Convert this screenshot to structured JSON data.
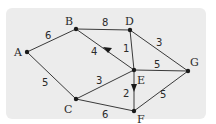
{
  "diagram": {
    "type": "weighted graph",
    "nodes": [
      {
        "id": "A",
        "label": "A",
        "x": 27,
        "y": 52
      },
      {
        "id": "B",
        "label": "B",
        "x": 76,
        "y": 29
      },
      {
        "id": "C",
        "label": "C",
        "x": 76,
        "y": 99
      },
      {
        "id": "D",
        "label": "D",
        "x": 130,
        "y": 30
      },
      {
        "id": "E",
        "label": "E",
        "x": 134,
        "y": 70
      },
      {
        "id": "F",
        "label": "F",
        "x": 134,
        "y": 111
      },
      {
        "id": "G",
        "label": "G",
        "x": 188,
        "y": 71
      }
    ],
    "edges": [
      {
        "from": "A",
        "to": "B",
        "weight": "6",
        "directed": false
      },
      {
        "from": "A",
        "to": "C",
        "weight": "5",
        "directed": false
      },
      {
        "from": "B",
        "to": "D",
        "weight": "8",
        "directed": false
      },
      {
        "from": "E",
        "to": "B",
        "weight": "4",
        "directed": true
      },
      {
        "from": "D",
        "to": "E",
        "weight": "1",
        "directed": false
      },
      {
        "from": "D",
        "to": "G",
        "weight": "3",
        "directed": false
      },
      {
        "from": "C",
        "to": "E",
        "weight": "3",
        "directed": false
      },
      {
        "from": "E",
        "to": "G",
        "weight": "5",
        "directed": false
      },
      {
        "from": "E",
        "to": "F",
        "weight": "2",
        "directed": true
      },
      {
        "from": "C",
        "to": "F",
        "weight": "6",
        "directed": false
      },
      {
        "from": "F",
        "to": "G",
        "weight": "5",
        "directed": false
      }
    ],
    "colors": {
      "panel": "#ececec",
      "edge": "#3a3a3a",
      "node": "#1a1a1a"
    }
  }
}
